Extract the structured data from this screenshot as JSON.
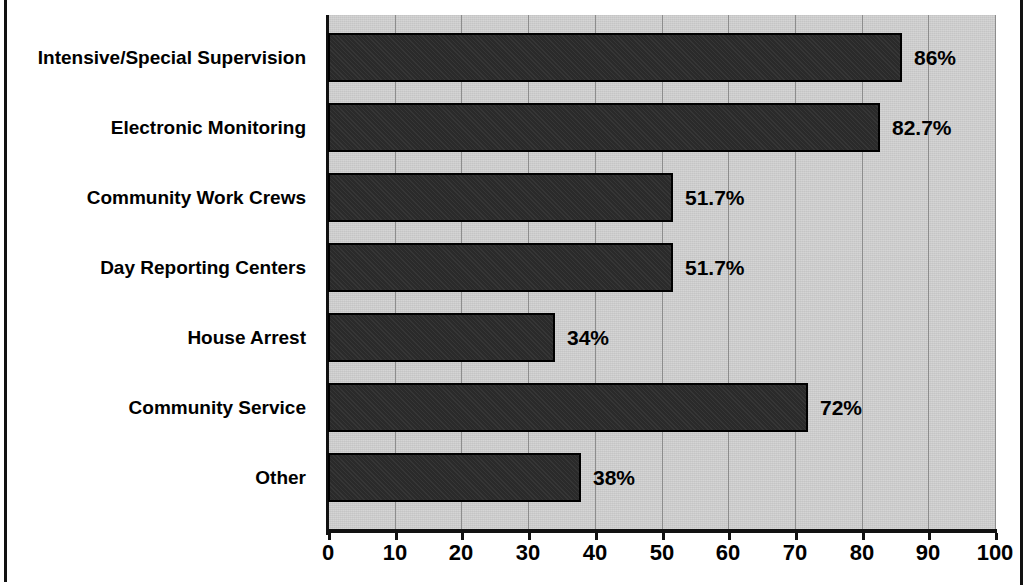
{
  "chart_data": {
    "type": "bar",
    "orientation": "horizontal",
    "title": "",
    "xlabel": "",
    "ylabel": "",
    "xlim": [
      0,
      100
    ],
    "xticks": [
      "0",
      "10",
      "20",
      "30",
      "40",
      "50",
      "60",
      "70",
      "80",
      "90",
      "100"
    ],
    "grid": true,
    "legend": false,
    "categories": [
      "Intensive/Special Supervision",
      "Electronic Monitoring",
      "Community Work Crews",
      "Day Reporting Centers",
      "House Arrest",
      "Community Service",
      "Other"
    ],
    "values": [
      86,
      82.7,
      51.7,
      51.7,
      34,
      72,
      38
    ],
    "value_labels": [
      "86%",
      "82.7%",
      "51.7%",
      "51.7%",
      "34%",
      "72%",
      "38%"
    ],
    "colors": {
      "bar_fill": "#2a2a2a",
      "bar_outline": "#000000",
      "plot_background": "#d2d2d2",
      "gridline": "#8d8d8d",
      "axis": "#111111",
      "text": "#000000",
      "page_background": "#ffffff"
    }
  }
}
